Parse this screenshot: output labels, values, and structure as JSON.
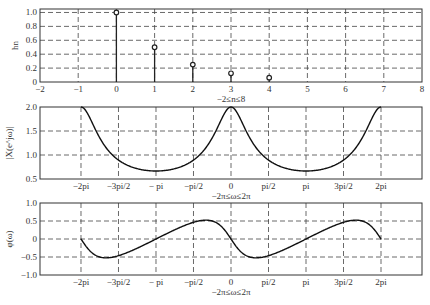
{
  "chart_data": [
    {
      "type": "stem",
      "title": "",
      "xlabel": "−2≤n≤8",
      "ylabel": "hn",
      "xlim": [
        -2,
        8
      ],
      "ylim": [
        0,
        1.05
      ],
      "grid": true,
      "x_ticks": [
        "−2",
        "−1",
        "0",
        "1",
        "2",
        "3",
        "4",
        "5",
        "6",
        "7",
        "8"
      ],
      "y_ticks": [
        "0",
        "0.2",
        "0.4",
        "0.6",
        "0.8",
        "1.0"
      ],
      "x": [
        0,
        1,
        2,
        3,
        4
      ],
      "values": [
        1.0,
        0.5,
        0.25,
        0.125,
        0.0625
      ]
    },
    {
      "type": "line",
      "title": "",
      "xlabel": "−2π≤ω≤2π",
      "ylabel": "|X(e^jω)|",
      "xlim": [
        -8,
        8
      ],
      "ylim": [
        0.5,
        2.0
      ],
      "grid": true,
      "x_ticks": [
        "−2pi",
        "−3pi/2",
        "− pi",
        "−pi/2",
        "0",
        "pi/2",
        "pi",
        "3pi/2",
        "2pi"
      ],
      "y_ticks": [
        "0.5",
        "1.0",
        "1.5",
        "2.0"
      ],
      "function": "1/|1-0.5e^{-jω}|",
      "x": [
        "-2pi",
        "-3pi/2",
        "-pi",
        "-pi/2",
        "0",
        "pi/2",
        "pi",
        "3pi/2",
        "2pi"
      ],
      "values": [
        2.0,
        0.894,
        0.667,
        0.894,
        2.0,
        0.894,
        0.667,
        0.894,
        2.0
      ]
    },
    {
      "type": "line",
      "title": "",
      "xlabel": "−2π≤ω≤2π",
      "ylabel": "φ(ω)",
      "xlim": [
        -8,
        8
      ],
      "ylim": [
        -1.0,
        1.0
      ],
      "grid": true,
      "x_ticks": [
        "−2pi",
        "−3pi/2",
        "− pi",
        "−pi/2",
        "0",
        "pi/2",
        "pi",
        "3pi/2",
        "2pi"
      ],
      "y_ticks": [
        "−1.0",
        "−0.5",
        "0",
        "0.5",
        "1.0"
      ],
      "function": "-atan(0.5 sin ω /(1-0.5 cos ω))",
      "x": [
        "-2pi",
        "-3pi/2",
        "-pi",
        "-pi/2",
        "0",
        "pi/2",
        "pi",
        "3pi/2",
        "2pi"
      ],
      "values": [
        0,
        -0.464,
        0,
        0.464,
        0,
        -0.464,
        0,
        0.464,
        0
      ]
    }
  ]
}
